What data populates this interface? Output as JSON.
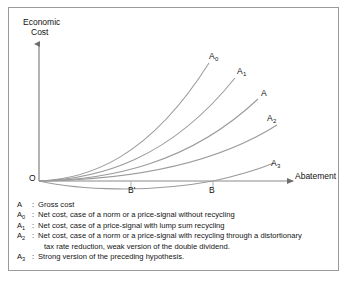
{
  "figure": {
    "y_axis_title_line1": "Economic",
    "y_axis_title_line2": "Cost",
    "x_axis_title": "Abatement",
    "origin_label": "O",
    "tick_labels": {
      "b_prime": "B'",
      "b": "B"
    },
    "curve_labels": {
      "a0_base": "A",
      "a0_sub": "0",
      "a1_base": "A",
      "a1_sub": "1",
      "a_base": "A",
      "a2_base": "A",
      "a2_sub": "2",
      "a3_base": "A",
      "a3_sub": "3"
    }
  },
  "legend": {
    "rows": [
      {
        "key_base": "A",
        "key_sub": "",
        "colon": ":",
        "text": "Gross cost",
        "text_cont": ""
      },
      {
        "key_base": "A",
        "key_sub": "0",
        "colon": ":",
        "text": "Net cost, case of a norm or a price-signal without recycling",
        "text_cont": ""
      },
      {
        "key_base": "A",
        "key_sub": "1",
        "colon": ":",
        "text": "Net cost, case of a price-signal with lump sum recycling",
        "text_cont": ""
      },
      {
        "key_base": "A",
        "key_sub": "2",
        "colon": ":",
        "text": "Net cost, case of a norm or a price-signal with recycling through a distortionary",
        "text_cont": "tax rate reduction, weak version of the double dividend."
      },
      {
        "key_base": "A",
        "key_sub": "3",
        "colon": ":",
        "text": "Strong version of the preceding hypothesis.",
        "text_cont": ""
      }
    ]
  },
  "chart_data": {
    "type": "line",
    "title": "",
    "xlabel": "Abatement",
    "ylabel": "Economic Cost",
    "grid": false,
    "legend_position": "below-plot",
    "axis_origin_label": "O",
    "x_tick_labels": [
      "B'",
      "B"
    ],
    "x_tick_values": [
      0.36,
      0.73
    ],
    "xlim": [
      0,
      1
    ],
    "ylim": [
      -0.12,
      1.0
    ],
    "note": "Five cost curves rising from the common origin; A3 dips below the abatement axis before rising.",
    "series": [
      {
        "name": "A0",
        "label": "A0",
        "description": "Net cost, case of a norm or a price-signal without recycling",
        "x": [
          0.0,
          0.12,
          0.24,
          0.36,
          0.48,
          0.58,
          0.66,
          0.73
        ],
        "y": [
          0.0,
          0.02,
          0.07,
          0.16,
          0.31,
          0.47,
          0.62,
          0.78
        ]
      },
      {
        "name": "A1",
        "label": "A1",
        "description": "Net cost, case of a price-signal with lump sum recycling",
        "x": [
          0.0,
          0.14,
          0.28,
          0.42,
          0.55,
          0.66,
          0.75,
          0.82
        ],
        "y": [
          0.0,
          0.02,
          0.06,
          0.14,
          0.26,
          0.4,
          0.54,
          0.66
        ]
      },
      {
        "name": "A",
        "label": "A",
        "description": "Gross cost",
        "x": [
          0.0,
          0.16,
          0.32,
          0.47,
          0.61,
          0.73,
          0.83,
          0.9
        ],
        "y": [
          0.0,
          0.02,
          0.05,
          0.11,
          0.21,
          0.33,
          0.44,
          0.54
        ]
      },
      {
        "name": "A2",
        "label": "A2",
        "description": "Net cost, case of a norm or a price-signal with recycling through a distortionary tax rate reduction, weak version of the double dividend.",
        "x": [
          0.0,
          0.18,
          0.36,
          0.52,
          0.66,
          0.78,
          0.88,
          0.94
        ],
        "y": [
          0.0,
          0.01,
          0.04,
          0.08,
          0.15,
          0.23,
          0.31,
          0.37
        ]
      },
      {
        "name": "A3",
        "label": "A3",
        "description": "Strong version of the preceding hypothesis.",
        "x": [
          0.0,
          0.12,
          0.24,
          0.36,
          0.48,
          0.6,
          0.73,
          0.84,
          0.92
        ],
        "y": [
          0.0,
          -0.03,
          -0.045,
          -0.05,
          -0.045,
          -0.03,
          0.0,
          0.04,
          0.08
        ]
      }
    ]
  }
}
